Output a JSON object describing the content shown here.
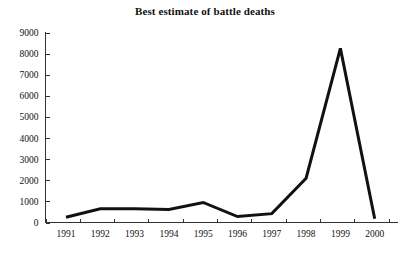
{
  "chart_data": {
    "type": "line",
    "title": "Best estimate of battle deaths",
    "xlabel": "",
    "ylabel": "",
    "categories": [
      "1991",
      "1992",
      "1993",
      "1994",
      "1995",
      "1996",
      "1997",
      "1998",
      "1999",
      "2000"
    ],
    "values": [
      250,
      650,
      650,
      620,
      950,
      280,
      420,
      2100,
      8250,
      180
    ],
    "series": [
      {
        "name": "Best estimate of battle deaths",
        "values": [
          250,
          650,
          650,
          620,
          950,
          280,
          420,
          2100,
          8250,
          180
        ]
      }
    ],
    "ylim": [
      0,
      9000
    ],
    "ytick_values": [
      0,
      1000,
      2000,
      3000,
      4000,
      5000,
      6000,
      7000,
      8000,
      9000
    ],
    "ytick_labels": [
      "0",
      "1000",
      "2000",
      "3000",
      "4000",
      "5000",
      "6000",
      "7000",
      "8000",
      "9000"
    ],
    "xtick_labels": [
      "1991",
      "1992",
      "1993",
      "1994",
      "1995",
      "1996",
      "1997",
      "1998",
      "1999",
      "2000"
    ],
    "grid": false,
    "legend": null,
    "legend_position": "none",
    "line_color": "#111111",
    "axis_color": "#333333",
    "background_color": "#ffffff"
  }
}
